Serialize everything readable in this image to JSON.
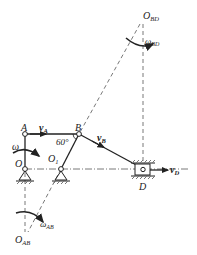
{
  "diagram": {
    "labels": {
      "O_BD": "O",
      "O_BD_sub": "BD",
      "omega_BD": "ω",
      "omega_BD_sub": "BD",
      "A": "A",
      "v_A": "v",
      "v_A_sub": "A",
      "B": "B",
      "angle": "60°",
      "v_B": "v",
      "v_B_sub": "B",
      "omega": "ω",
      "O": "O",
      "O1": "O",
      "O1_sub": "1",
      "D": "D",
      "v_D": "v",
      "v_D_sub": "D",
      "O_AB": "O",
      "O_AB_sub": "AB",
      "omega_AB": "ω",
      "omega_AB_sub": "AB"
    },
    "points": {
      "A": [
        25,
        134
      ],
      "B": [
        79,
        134
      ],
      "O": [
        25,
        169
      ],
      "O1": [
        61,
        169
      ],
      "D": [
        143,
        169
      ],
      "O_BD": [
        143,
        22
      ],
      "O_AB": [
        25,
        233
      ]
    },
    "colors": {
      "line": "#222222",
      "dash": "#555555",
      "hatch": "#777777"
    }
  }
}
